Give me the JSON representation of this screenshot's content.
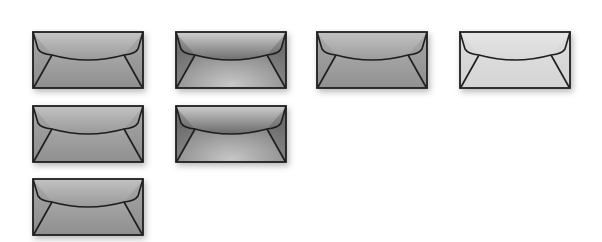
{
  "envelopes": [
    {
      "id": "envelope-1",
      "x": 32,
      "y": 31,
      "style": "flat-mid",
      "top": "#b8b8b8",
      "bottom": "#8e8e8e",
      "flap_top": "#c4c4c4",
      "flap_bottom": "#9a9a9a",
      "sides": "#8a8a8a"
    },
    {
      "id": "envelope-2",
      "x": 175,
      "y": 31,
      "style": "radial-dark",
      "top": "#7c7c7c",
      "bottom": "#c8c8c8",
      "flap_top": "#cfcfcf",
      "flap_bottom": "#6e6e6e",
      "sides": "#555555"
    },
    {
      "id": "envelope-3",
      "x": 316,
      "y": 31,
      "style": "flat-mid",
      "top": "#b4b4b4",
      "bottom": "#909090",
      "flap_top": "#c2c2c2",
      "flap_bottom": "#9c9c9c",
      "sides": "#8c8c8c"
    },
    {
      "id": "envelope-4",
      "x": 459,
      "y": 31,
      "style": "light",
      "top": "#e2e2e2",
      "bottom": "#d4d4d4",
      "flap_top": "#e6e6e6",
      "flap_bottom": "#d8d8d8",
      "sides": "#d0d0d0"
    },
    {
      "id": "envelope-5",
      "x": 32,
      "y": 105,
      "style": "flat-mid",
      "top": "#b6b6b6",
      "bottom": "#8f8f8f",
      "flap_top": "#c2c2c2",
      "flap_bottom": "#999999",
      "sides": "#8a8a8a"
    },
    {
      "id": "envelope-6",
      "x": 175,
      "y": 105,
      "style": "radial-dark",
      "top": "#7a7a7a",
      "bottom": "#c6c6c6",
      "flap_top": "#cccccc",
      "flap_bottom": "#6a6a6a",
      "sides": "#525252"
    },
    {
      "id": "envelope-7",
      "x": 32,
      "y": 178,
      "style": "flat-mid",
      "top": "#b6b6b6",
      "bottom": "#8e8e8e",
      "flap_top": "#c2c2c2",
      "flap_bottom": "#989898",
      "sides": "#8a8a8a"
    }
  ],
  "stroke_color": "#1e1e1e",
  "background": "#ffffff"
}
